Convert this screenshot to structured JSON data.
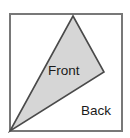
{
  "figure": {
    "name": "front-back-fold-diagram",
    "width": 130,
    "height": 138,
    "background_color": "#ffffff"
  },
  "colors": {
    "page_background": "#ffffff",
    "square_stroke": "#787878",
    "square_fill": "#ffffff",
    "triangle_fill": "#d6d6d6",
    "triangle_stroke": "#4a4a4a",
    "label_text": "#1a1a1a"
  },
  "shapes": {
    "square": {
      "name": "outer-square",
      "stroke_width": 2,
      "x": 10,
      "y": 14,
      "width": 112,
      "height": 117
    },
    "triangle": {
      "name": "front-flap-triangle",
      "stroke_width": 1.6,
      "points": "73,16 104,72 10,131"
    }
  },
  "labels": {
    "front": {
      "text": "Front",
      "x": 48,
      "y": 75
    },
    "back": {
      "text": "Back",
      "x": 81,
      "y": 115
    }
  }
}
